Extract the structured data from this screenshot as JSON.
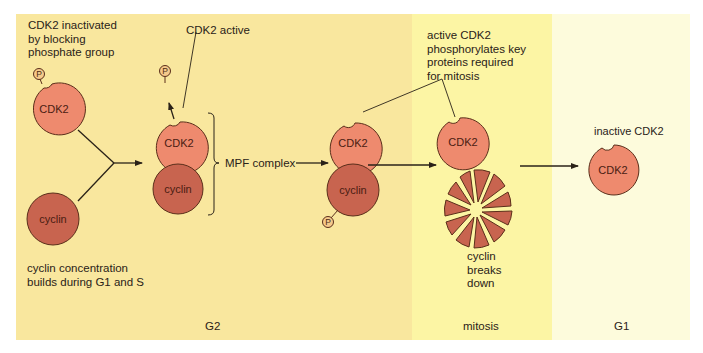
{
  "phases": {
    "g2": "G2",
    "mitosis": "mitosis",
    "g1": "G1"
  },
  "labels": {
    "cdk2_inactivated": [
      "CDK2 inactivated",
      "by blocking",
      "phosphate group"
    ],
    "cyclin_concentration": [
      "cyclin concentration",
      "builds during G1 and S"
    ],
    "cdk2_active": "CDK2 active",
    "mpf_complex": "MPF complex",
    "active_cdk2_phosphorylates": [
      "active CDK2",
      "phosphorylates key",
      "proteins required",
      "for mitosis"
    ],
    "cyclin_breaks_down": [
      "cyclin",
      "breaks",
      "down"
    ],
    "inactive_cdk2": "inactive CDK2"
  },
  "molecules": {
    "cdk2": "CDK2",
    "cyclin": "cyclin",
    "phosphate": "P"
  },
  "colors": {
    "g2_bg": "#f9e79e",
    "mitosis_bg": "#fcf5a4",
    "g1_bg": "#fdfbdc",
    "cdk2_fill": "#ee8a6e",
    "cyclin_fill": "#c8644f",
    "phosphate_fill": "#f6c98a",
    "outline": "#5a2e1a"
  }
}
